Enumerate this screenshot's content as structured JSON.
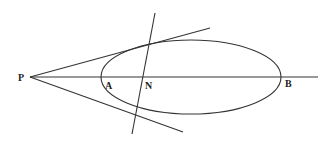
{
  "diagram": {
    "type": "geometry",
    "labels": {
      "P": "P",
      "A": "A",
      "N": "N",
      "B": "B"
    },
    "points": {
      "P": [
        30,
        77
      ],
      "A": [
        101,
        77
      ],
      "N": [
        146,
        77
      ],
      "B": [
        281,
        77
      ]
    },
    "ellipse": {
      "cx": 191,
      "cy": 77,
      "rx": 90,
      "ry": 37
    },
    "lines": {
      "axis": [
        [
          30,
          77
        ],
        [
          318,
          77
        ]
      ],
      "upper_tangent": [
        [
          30,
          77
        ],
        [
          210,
          28
        ]
      ],
      "lower_tangent": [
        [
          30,
          77
        ],
        [
          183,
          132
        ]
      ],
      "chord_of_contact": [
        [
          155,
          13
        ],
        [
          132,
          134
        ]
      ]
    },
    "colors": {
      "stroke": "#333333",
      "label": "#222222",
      "background": "#ffffff"
    }
  }
}
